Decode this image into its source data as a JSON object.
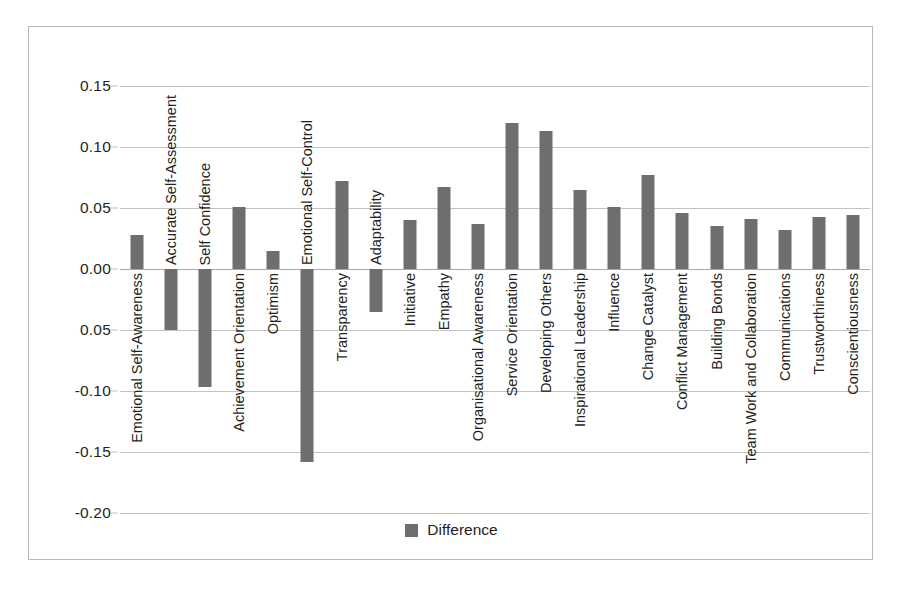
{
  "chart_data": {
    "type": "bar",
    "title": "",
    "xlabel": "",
    "ylabel": "",
    "ylim": [
      -0.2,
      0.15
    ],
    "ytick_labels": [
      "0.15",
      "0.10",
      "0.05",
      "0.00",
      "0.05",
      "-0.10",
      "-0.15",
      "-0.20"
    ],
    "ytick_values": [
      0.15,
      0.1,
      0.05,
      0.0,
      -0.05,
      -0.1,
      -0.15,
      -0.2
    ],
    "grid": true,
    "legend_position": "bottom",
    "legend": [
      "Difference"
    ],
    "series_name": "Difference",
    "bar_color": "#6e6e6e",
    "categories": [
      "Emotional Self-Awareness",
      "Accurate Self-Assessment",
      "Self Confidence",
      "Achievement Orientation",
      "Optimism",
      "Emotional Self-Control",
      "Transparency",
      "Adaptability",
      "Initiative",
      "Empathy",
      "Organisational Awareness",
      "Service Orientation",
      "Developing Others",
      "Inspirational Leadership",
      "Influence",
      "Change Catalyst",
      "Conflict Management",
      "Building Bonds",
      "Team Work and Collaboration",
      "Communications",
      "Trustworthiness",
      "Conscientiousness"
    ],
    "values": [
      0.028,
      -0.05,
      -0.097,
      0.051,
      0.015,
      -0.158,
      0.072,
      -0.035,
      0.04,
      0.067,
      0.037,
      0.12,
      0.113,
      0.065,
      0.051,
      0.077,
      0.046,
      0.035,
      0.041,
      0.032,
      0.043,
      0.044
    ]
  },
  "legend": {
    "label": "Difference"
  }
}
